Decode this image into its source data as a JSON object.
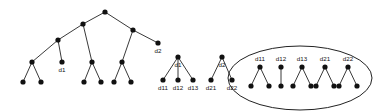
{
  "figure": {
    "background_color": "#ffffff",
    "node_color": "#111111",
    "edge_color": "#222222",
    "node_radius": 2.6,
    "ellipse_color": "#222222",
    "labels": {
      "d1": "d1",
      "d2": "d2",
      "d11": "d11",
      "d12": "d12",
      "d13": "d13",
      "d21": "d21",
      "d22": "d22"
    }
  },
  "diagram_data": {
    "type": "node-link-tree",
    "panels": [
      {
        "name": "main-tree",
        "description": "Large unlabeled hierarchical tree with two labeled leaves d1 and d2",
        "nodes": [
          {
            "id": "root",
            "x": 105,
            "y": 12,
            "label": ""
          },
          {
            "id": "a",
            "x": 83,
            "y": 24,
            "label": ""
          },
          {
            "id": "b",
            "x": 133,
            "y": 30,
            "label": ""
          },
          {
            "id": "c",
            "x": 58,
            "y": 40,
            "label": ""
          },
          {
            "id": "d2",
            "x": 158,
            "y": 43,
            "label": "d2"
          },
          {
            "id": "e",
            "x": 32,
            "y": 62,
            "label": ""
          },
          {
            "id": "d1",
            "x": 62,
            "y": 62,
            "label": "d1"
          },
          {
            "id": "f",
            "x": 92,
            "y": 62,
            "label": ""
          },
          {
            "id": "g",
            "x": 122,
            "y": 62,
            "label": ""
          },
          {
            "id": "e1",
            "x": 23,
            "y": 82,
            "label": ""
          },
          {
            "id": "e2",
            "x": 41,
            "y": 82,
            "label": ""
          },
          {
            "id": "f1",
            "x": 84,
            "y": 82,
            "label": ""
          },
          {
            "id": "f2",
            "x": 101,
            "y": 82,
            "label": ""
          },
          {
            "id": "g1",
            "x": 114,
            "y": 82,
            "label": ""
          },
          {
            "id": "g2",
            "x": 131,
            "y": 82,
            "label": ""
          }
        ],
        "edges": [
          [
            "root",
            "a"
          ],
          [
            "root",
            "b"
          ],
          [
            "a",
            "c"
          ],
          [
            "a",
            "f"
          ],
          [
            "b",
            "g"
          ],
          [
            "b",
            "d2"
          ],
          [
            "c",
            "e"
          ],
          [
            "c",
            "d1"
          ],
          [
            "e",
            "e1"
          ],
          [
            "e",
            "e2"
          ],
          [
            "f",
            "f1"
          ],
          [
            "f",
            "f2"
          ],
          [
            "g",
            "g1"
          ],
          [
            "g",
            "g2"
          ]
        ]
      },
      {
        "name": "d1-subtree",
        "description": "Subtree rooted at d1 with children d11, d12, d13",
        "nodes": [
          {
            "id": "d1",
            "x": 178,
            "y": 57,
            "label": "d1"
          },
          {
            "id": "d11",
            "x": 163,
            "y": 80,
            "label": "d11"
          },
          {
            "id": "d12",
            "x": 178,
            "y": 80,
            "label": "d12"
          },
          {
            "id": "d13",
            "x": 193,
            "y": 80,
            "label": "d13"
          }
        ],
        "edges": [
          [
            "d1",
            "d11"
          ],
          [
            "d1",
            "d12"
          ],
          [
            "d1",
            "d13"
          ]
        ]
      },
      {
        "name": "d2-subtree",
        "description": "Subtree rooted at d2 with children d21, d22",
        "nodes": [
          {
            "id": "d2",
            "x": 222,
            "y": 57,
            "label": "d2"
          },
          {
            "id": "d21",
            "x": 211,
            "y": 80,
            "label": "d21"
          },
          {
            "id": "d22",
            "x": 232,
            "y": 80,
            "label": "d22"
          }
        ],
        "edges": [
          [
            "d2",
            "d21"
          ],
          [
            "d2",
            "d22"
          ]
        ]
      },
      {
        "name": "grouped-subtrees",
        "description": "Five small subtrees enclosed in an ellipse",
        "ellipse": {
          "cx": 300,
          "cy": 78,
          "rx": 72,
          "ry": 32
        },
        "groups": [
          {
            "root": {
              "id": "d11",
              "x": 260,
              "y": 67,
              "label": "d11"
            },
            "children": [
              {
                "id": "d11a",
                "x": 251,
                "y": 86
              },
              {
                "id": "d11b",
                "x": 269,
                "y": 86
              }
            ]
          },
          {
            "root": {
              "id": "d12",
              "x": 281,
              "y": 67,
              "label": "d12"
            },
            "children": [
              {
                "id": "d12a",
                "x": 281,
                "y": 86
              }
            ]
          },
          {
            "root": {
              "id": "d13",
              "x": 302,
              "y": 67,
              "label": "d13"
            },
            "children": [
              {
                "id": "d13a",
                "x": 293,
                "y": 86
              },
              {
                "id": "d13b",
                "x": 311,
                "y": 86
              }
            ]
          },
          {
            "root": {
              "id": "d21",
              "x": 325,
              "y": 67,
              "label": "d21"
            },
            "children": [
              {
                "id": "d21a",
                "x": 316,
                "y": 86
              },
              {
                "id": "d21b",
                "x": 334,
                "y": 86
              }
            ]
          },
          {
            "root": {
              "id": "d22",
              "x": 348,
              "y": 67,
              "label": "d22"
            },
            "children": [
              {
                "id": "d22a",
                "x": 339,
                "y": 86
              },
              {
                "id": "d22b",
                "x": 357,
                "y": 86
              }
            ]
          }
        ]
      }
    ]
  }
}
